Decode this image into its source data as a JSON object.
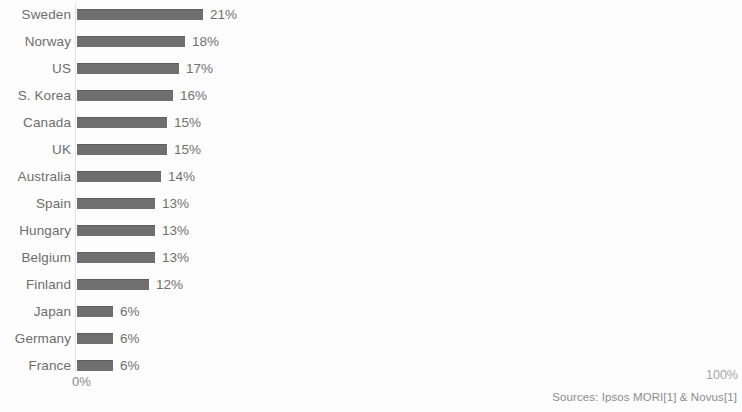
{
  "chart_data": {
    "type": "bar",
    "orientation": "horizontal",
    "title": "",
    "xlabel": "",
    "ylabel": "",
    "xlim": [
      0,
      100
    ],
    "grid": false,
    "legend": null,
    "categories": [
      "Sweden",
      "Norway",
      "US",
      "S. Korea",
      "Canada",
      "UK",
      "Australia",
      "Spain",
      "Hungary",
      "Belgium",
      "Finland",
      "Japan",
      "Germany",
      "France"
    ],
    "values": [
      21,
      18,
      17,
      16,
      15,
      15,
      14,
      13,
      13,
      13,
      12,
      6,
      6,
      6
    ],
    "value_labels": [
      "21%",
      "18%",
      "17%",
      "16%",
      "15%",
      "15%",
      "14%",
      "13%",
      "13%",
      "13%",
      "12%",
      "6%",
      "6%",
      "6%"
    ],
    "axis_ticks": [
      "0%",
      "100%"
    ],
    "bars": [
      {
        "label": "Sweden",
        "value": 21,
        "value_label": "21%"
      },
      {
        "label": "Norway",
        "value": 18,
        "value_label": "18%"
      },
      {
        "label": "US",
        "value": 17,
        "value_label": "17%"
      },
      {
        "label": "S. Korea",
        "value": 16,
        "value_label": "16%"
      },
      {
        "label": "Canada",
        "value": 15,
        "value_label": "15%"
      },
      {
        "label": "UK",
        "value": 15,
        "value_label": "15%"
      },
      {
        "label": "Australia",
        "value": 14,
        "value_label": "14%"
      },
      {
        "label": "Spain",
        "value": 13,
        "value_label": "13%"
      },
      {
        "label": "Hungary",
        "value": 13,
        "value_label": "13%"
      },
      {
        "label": "Belgium",
        "value": 13,
        "value_label": "13%"
      },
      {
        "label": "Finland",
        "value": 12,
        "value_label": "12%"
      },
      {
        "label": "Japan",
        "value": 6,
        "value_label": "6%"
      },
      {
        "label": "Germany",
        "value": 6,
        "value_label": "6%"
      },
      {
        "label": "France",
        "value": 6,
        "value_label": "6%"
      }
    ],
    "colors": {
      "bar": "#6f6f6f",
      "bar_edge": "#5e5e5e",
      "label_text": "#6d6d6d",
      "value_text": "#707070",
      "axis_text": "#8a8a8a",
      "axis_line": "#e3e3e3",
      "background": "#fdfdfd"
    }
  },
  "axis": {
    "min_label": "0%",
    "max_label": "100%"
  },
  "footer": {
    "sources": "Sources: Ipsos MORI[1] & Novus[1]"
  }
}
